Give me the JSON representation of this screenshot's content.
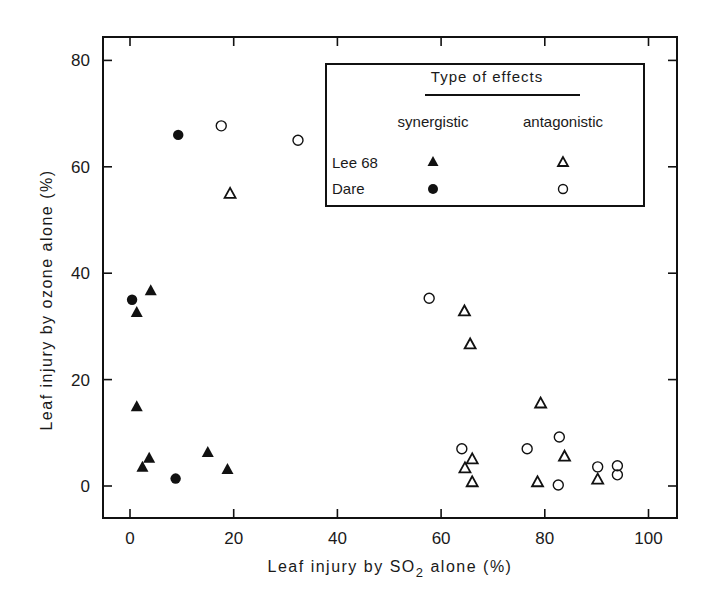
{
  "chart_data": {
    "type": "scatter",
    "title": "",
    "xlabel": "Leaf injury by SO2 alone (%)",
    "xlabel_parts": {
      "pre": "Leaf  injury  by  SO",
      "sub": "2",
      "post": " alone (%)"
    },
    "ylabel": "Leaf injury by ozone alone (%)",
    "xlim": [
      -5,
      105
    ],
    "ylim": [
      -6,
      84
    ],
    "xticks": [
      0,
      20,
      40,
      60,
      80,
      100
    ],
    "yticks": [
      0,
      20,
      40,
      60,
      80
    ],
    "grid": false,
    "legend": {
      "position": "upper right",
      "title": "Type of effects",
      "columns": [
        "synergistic",
        "antagonistic"
      ],
      "rows": [
        {
          "label": "Lee 68",
          "synergistic_marker": "filled-triangle",
          "antagonistic_marker": "open-triangle"
        },
        {
          "label": "Dare",
          "synergistic_marker": "filled-circle",
          "antagonistic_marker": "open-circle"
        }
      ]
    },
    "series": [
      {
        "name": "Lee 68 synergistic",
        "marker": "filled-triangle",
        "points": [
          [
            1.3,
            32.7
          ],
          [
            4,
            36.8
          ],
          [
            1.3,
            15
          ],
          [
            3.7,
            5.3
          ],
          [
            2.4,
            3.6
          ],
          [
            15,
            6.4
          ],
          [
            18.8,
            3.2
          ]
        ]
      },
      {
        "name": "Dare synergistic",
        "marker": "filled-circle",
        "points": [
          [
            9.3,
            66
          ],
          [
            0.4,
            35
          ],
          [
            8.8,
            1.4
          ]
        ]
      },
      {
        "name": "Lee 68 antagonistic",
        "marker": "open-triangle",
        "points": [
          [
            19.3,
            55
          ],
          [
            64.5,
            32.9
          ],
          [
            65.6,
            26.7
          ],
          [
            66,
            5.1
          ],
          [
            64.6,
            3.4
          ],
          [
            66,
            0.8
          ],
          [
            79.2,
            15.6
          ],
          [
            83.8,
            5.6
          ],
          [
            78.6,
            0.8
          ],
          [
            90.2,
            1.3
          ]
        ]
      },
      {
        "name": "Dare antagonistic",
        "marker": "open-circle",
        "points": [
          [
            17.6,
            67.7
          ],
          [
            32.4,
            65
          ],
          [
            57.7,
            35.3
          ],
          [
            64,
            7
          ],
          [
            76.6,
            7
          ],
          [
            82.8,
            9.2
          ],
          [
            82.6,
            0.2
          ],
          [
            90.2,
            3.6
          ],
          [
            94,
            3.8
          ],
          [
            94,
            2.1
          ]
        ]
      }
    ]
  }
}
